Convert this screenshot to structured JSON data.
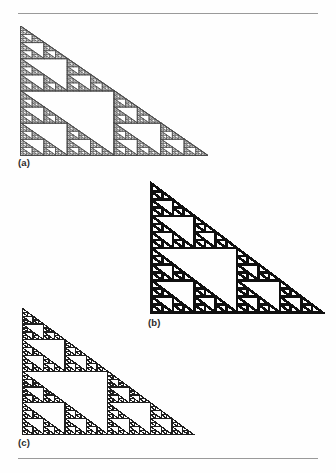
{
  "page": {
    "background_color": "#fefefe",
    "rule_color": "#9a9a9a",
    "ink_color": "#1a1a1a",
    "width": 336,
    "height": 473
  },
  "rules": [
    {
      "name": "top-rule",
      "y": 13
    },
    {
      "name": "bottom-rule",
      "y": 458
    }
  ],
  "captions": {
    "a": "(a)",
    "b": "(b)",
    "c": "(c)"
  },
  "chart_data": {
    "type": "diagram",
    "title": "",
    "subtitle": "",
    "figure_kind": "sierpinski-right-triangle-fractal",
    "panels": [
      {
        "label": "(a)",
        "name": "fractal-panel-a",
        "orientation": "right-angle-top-left",
        "legs": {
          "vertical": "left",
          "horizontal": "bottom"
        },
        "width": 187,
        "height": 129,
        "recursion_depth": 6,
        "stroke_width": 0.45,
        "stroke_color": "#4a4a4a",
        "appearance": "very thin hairlines, light grey, finest detail"
      },
      {
        "label": "(b)",
        "name": "fractal-panel-b",
        "orientation": "right-angle-top-left",
        "legs": {
          "vertical": "left",
          "horizontal": "bottom"
        },
        "width": 171,
        "height": 129,
        "recursion_depth": 4,
        "stroke_width": 2.6,
        "stroke_color": "#101010",
        "appearance": "heavy solid black strokes, coarsest detail"
      },
      {
        "label": "(c)",
        "name": "fractal-panel-c",
        "orientation": "right-angle-top-left",
        "legs": {
          "vertical": "left",
          "horizontal": "bottom"
        },
        "width": 171,
        "height": 126,
        "recursion_depth": 5,
        "stroke_width": 1.25,
        "stroke_color": "#1f1f1f",
        "appearance": "medium weight strokes, intermediate detail"
      }
    ],
    "xlabel": "",
    "ylabel": "",
    "legend": [],
    "grid": false,
    "annotations": [
      "(a)",
      "(b)",
      "(c)"
    ]
  }
}
